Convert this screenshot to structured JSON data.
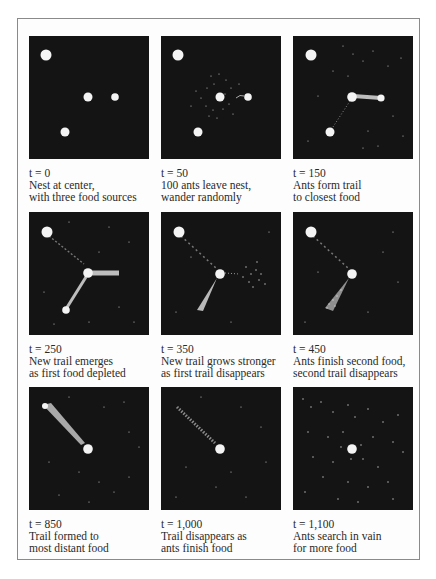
{
  "figure": {
    "panels": [
      {
        "time": "t = 0",
        "line1": "Nest at center,",
        "line2": "with three food sources"
      },
      {
        "time": "t = 50",
        "line1": "100 ants leave nest,",
        "line2": "wander randomly"
      },
      {
        "time": "t = 150",
        "line1": "Ants form trail",
        "line2": "to closest food"
      },
      {
        "time": "t = 250",
        "line1": "New trail emerges",
        "line2": "as first food depleted"
      },
      {
        "time": "t = 350",
        "line1": "New trail grows stronger",
        "line2": "as first trail disappears"
      },
      {
        "time": "t = 450",
        "line1": "Ants finish second food,",
        "line2": "second trail disappears"
      },
      {
        "time": "t = 850",
        "line1": "Trail formed to",
        "line2": "most distant food"
      },
      {
        "time": "t = 1,000",
        "line1": "Trail disappears as",
        "line2": "ants finish food"
      },
      {
        "time": "t = 1,100",
        "line1": "Ants search in vain",
        "line2": "for more food"
      }
    ],
    "colors": {
      "panel_bg": "#141414",
      "blob": "#f4f4f4",
      "trail": "#bdbdbd",
      "border": "#8a8a8a"
    }
  }
}
